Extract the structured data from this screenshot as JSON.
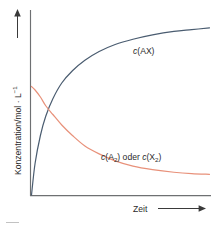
{
  "figure": {
    "kind": "chemical-kinetics-plot",
    "language": "de",
    "background_color": "#ffffff"
  },
  "axes": {
    "y_label_main": "Konzentration/mol",
    "y_label_middot": " · ",
    "y_label_unit": "L",
    "y_label_exponent": "−1",
    "y_label_full": "Konzentration/mol · L⁻¹",
    "x_label": "Zeit",
    "y_arrow": "arrow-up",
    "x_arrow": "arrow-right",
    "axis_color": "#6e7072",
    "tick_labels_x": [],
    "tick_labels_y": [],
    "grid": false
  },
  "series_labels": {
    "ax": {
      "symbol": "c",
      "body": "(AX)",
      "full": "c(AX)",
      "color": "#4a5c70"
    },
    "a2x2": {
      "symbol_1": "c",
      "open_1": "(A",
      "sub_1": "2",
      "close_1": ")",
      "conjunction": " oder ",
      "symbol_2": "c",
      "open_2": "(X",
      "sub_2": "2",
      "close_2": ")",
      "full": "c(A₂) oder c(X₂)",
      "color": "#e8917a"
    }
  },
  "caption": {
    "fragment": "",
    "visible": false
  },
  "chart_data": {
    "type": "line",
    "title": "",
    "xlabel": "Zeit",
    "ylabel": "Konzentration/mol · L⁻¹",
    "xlim": [
      0,
      1
    ],
    "ylim": [
      0,
      1
    ],
    "grid": false,
    "legend_position": "inline-annotations",
    "annotations": [
      {
        "text": "c(AX)",
        "x": 0.63,
        "y": 0.76,
        "series": "c(AX)"
      },
      {
        "text": "c(A₂) oder c(X₂)",
        "x": 0.55,
        "y": 0.2,
        "series": "c(A2) oder c(X2)"
      }
    ],
    "x": [
      0.0,
      0.02,
      0.05,
      0.08,
      0.12,
      0.17,
      0.23,
      0.3,
      0.38,
      0.47,
      0.57,
      0.68,
      0.8,
      0.9,
      1.0
    ],
    "series": [
      {
        "name": "c(AX)",
        "color": "#4a5c70",
        "description": "Produktkonzentration steigt monoton und nähert sich dem Gleichgewicht",
        "values": [
          0.0,
          0.18,
          0.34,
          0.45,
          0.55,
          0.64,
          0.71,
          0.77,
          0.82,
          0.86,
          0.89,
          0.915,
          0.935,
          0.945,
          0.955
        ]
      },
      {
        "name": "c(A2) oder c(X2)",
        "color": "#e8917a",
        "description": "Eduktkonzentration fällt monoton und nähert sich dem Gleichgewicht",
        "values": [
          0.62,
          0.6,
          0.56,
          0.51,
          0.46,
          0.4,
          0.34,
          0.28,
          0.235,
          0.195,
          0.165,
          0.145,
          0.13,
          0.122,
          0.118
        ]
      }
    ]
  }
}
